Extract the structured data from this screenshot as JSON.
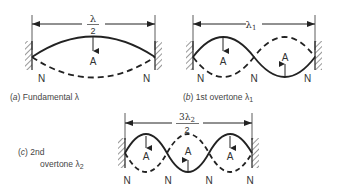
{
  "diagrams": {
    "a": {
      "dimension_label_num": "λ",
      "dimension_label_den": "2",
      "antinode_label": "A",
      "node_labels": [
        "N",
        "N"
      ],
      "caption_letter": "a",
      "caption_text": "Fundamental λ"
    },
    "b": {
      "dimension_label": "λ",
      "dimension_sub": "1",
      "antinode_labels": [
        "A",
        "A"
      ],
      "node_labels": [
        "N",
        "N",
        "N"
      ],
      "caption_letter": "b",
      "caption_text": "1st overtone λ",
      "caption_sub": "1"
    },
    "c": {
      "dimension_label_num": "3λ",
      "dimension_num_sub": "2",
      "dimension_label_den": "2",
      "antinode_labels": [
        "A",
        "A",
        "A"
      ],
      "node_labels": [
        "N",
        "N",
        "N",
        "N"
      ],
      "caption_letter": "c",
      "caption_line1": "2nd",
      "caption_line2": "overtone λ",
      "caption_sub": "2"
    }
  }
}
